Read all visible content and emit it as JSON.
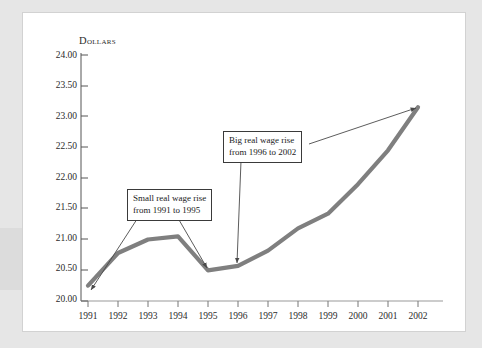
{
  "chart_data": {
    "type": "line",
    "title": "",
    "xlabel": "",
    "ylabel": "Dollars",
    "categories": [
      "1991",
      "1992",
      "1993",
      "1994",
      "1995",
      "1996",
      "1997",
      "1998",
      "1999",
      "2000",
      "2001",
      "2002"
    ],
    "x": [
      1991,
      1992,
      1993,
      1994,
      1995,
      1996,
      1997,
      1998,
      1999,
      2000,
      2001,
      2002
    ],
    "values": [
      20.25,
      20.78,
      21.0,
      21.05,
      20.5,
      20.57,
      20.82,
      21.18,
      21.42,
      21.9,
      22.45,
      23.15
    ],
    "series": [
      {
        "name": "Real wage",
        "values": [
          20.25,
          20.78,
          21.0,
          21.05,
          20.5,
          20.57,
          20.82,
          21.18,
          21.42,
          21.9,
          22.45,
          23.15
        ]
      }
    ],
    "ylim": [
      20.0,
      24.0
    ],
    "ytick_values": [
      20.0,
      20.5,
      21.0,
      21.5,
      22.0,
      22.5,
      23.0,
      23.5,
      24.0
    ],
    "ytick_labels": [
      "20.00",
      "20.50",
      "21.00",
      "21.50",
      "22.00",
      "22.50",
      "23.00",
      "23.50",
      "24.00"
    ],
    "xtick_labels": [
      "1991",
      "1992",
      "1993",
      "1994",
      "1995",
      "1996",
      "1997",
      "1998",
      "1999",
      "2000",
      "2001",
      "2002"
    ],
    "grid": false,
    "legend": "none",
    "line_color": "#7f7f7f",
    "axis_color": "#555555",
    "annotations": [
      {
        "id": "small-rise",
        "line1": "Small real wage rise",
        "line2": "from 1991 to 1995",
        "points_to": [
          "1991",
          "1995"
        ]
      },
      {
        "id": "big-rise",
        "line1": "Big real wage rise",
        "line2": "from 1996 to 2002",
        "points_to": [
          "1996",
          "2002"
        ]
      }
    ]
  },
  "axis": {
    "y_title": "Dollars",
    "y_labels": [
      "24.00",
      "23.50",
      "23.00",
      "22.50",
      "22.00",
      "21.50",
      "21.00",
      "20.50",
      "20.00"
    ],
    "x_labels": [
      "1991",
      "1992",
      "1993",
      "1994",
      "1995",
      "1996",
      "1997",
      "1998",
      "1999",
      "2000",
      "2001",
      "2002"
    ]
  },
  "annotations": {
    "small": {
      "line1": "Small real wage rise",
      "line2": "from 1991 to 1995"
    },
    "big": {
      "line1": "Big real wage rise",
      "line2": "from 1996 to 2002"
    }
  },
  "colors": {
    "page_background": "#e6e6e6",
    "card_background": "#ffffff",
    "line": "#7f7f7f",
    "axis": "#555555",
    "text": "#2b2b2b",
    "callout_border": "#3a3a3a"
  }
}
